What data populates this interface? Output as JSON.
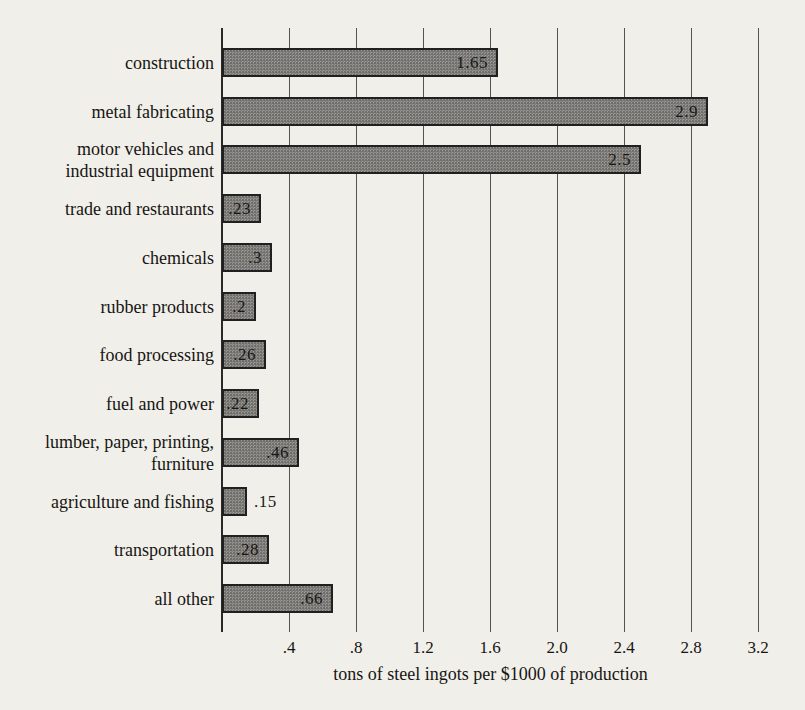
{
  "page": {
    "background_color": "#f1efe9",
    "text_color": "#161514"
  },
  "chart_data": {
    "type": "bar",
    "orientation": "horizontal",
    "title": "",
    "xlabel": "tons of steel ingots per $1000 of production",
    "ylabel": "",
    "xlim": [
      0,
      3.3
    ],
    "grid": true,
    "legend": "none",
    "categories": [
      "construction",
      "metal fabricating",
      "motor vehicles and industrial equipment",
      "trade and restaurants",
      "chemicals",
      "rubber products",
      "food processing",
      "fuel and power",
      "lumber, paper, printing, furniture",
      "agriculture and fishing",
      "transportation",
      "all other"
    ],
    "values": [
      1.65,
      2.9,
      2.5,
      0.23,
      0.3,
      0.2,
      0.26,
      0.22,
      0.46,
      0.15,
      0.28,
      0.66
    ],
    "bars": [
      {
        "label_lines": [
          "construction"
        ],
        "value": 1.65,
        "display": "1.65",
        "value_outside": false
      },
      {
        "label_lines": [
          "metal fabricating"
        ],
        "value": 2.9,
        "display": "2.9",
        "value_outside": false
      },
      {
        "label_lines": [
          "motor vehicles and",
          "industrial equipment"
        ],
        "value": 2.5,
        "display": "2.5",
        "value_outside": false
      },
      {
        "label_lines": [
          "trade and restaurants"
        ],
        "value": 0.23,
        "display": ".23",
        "value_outside": false
      },
      {
        "label_lines": [
          "chemicals"
        ],
        "value": 0.3,
        "display": ".3",
        "value_outside": false
      },
      {
        "label_lines": [
          "rubber products"
        ],
        "value": 0.2,
        "display": ".2",
        "value_outside": false
      },
      {
        "label_lines": [
          "food processing"
        ],
        "value": 0.26,
        "display": ".26",
        "value_outside": false
      },
      {
        "label_lines": [
          "fuel and power"
        ],
        "value": 0.22,
        "display": ".22",
        "value_outside": false
      },
      {
        "label_lines": [
          "lumber, paper, printing,",
          "furniture"
        ],
        "value": 0.46,
        "display": ".46",
        "value_outside": false
      },
      {
        "label_lines": [
          "agriculture and fishing"
        ],
        "value": 0.15,
        "display": ".15",
        "value_outside": true
      },
      {
        "label_lines": [
          "transportation"
        ],
        "value": 0.28,
        "display": ".28",
        "value_outside": false
      },
      {
        "label_lines": [
          "all other"
        ],
        "value": 0.66,
        "display": ".66",
        "value_outside": false
      }
    ],
    "x_ticks": [
      {
        "label": ".4",
        "value": 0.4
      },
      {
        "label": ".8",
        "value": 0.8
      },
      {
        "label": "1.2",
        "value": 1.2
      },
      {
        "label": "1.6",
        "value": 1.6
      },
      {
        "label": "2.0",
        "value": 2.0
      },
      {
        "label": "2.4",
        "value": 2.4
      },
      {
        "label": "2.8",
        "value": 2.8
      },
      {
        "label": "3.2",
        "value": 3.2
      }
    ],
    "colors": {
      "paper": "#f1efe9",
      "bar_fill": "#9b9a96",
      "bar_border": "#212020",
      "grid_line": "#555350",
      "axis_line": "#2b2a28",
      "text": "#161514"
    }
  }
}
